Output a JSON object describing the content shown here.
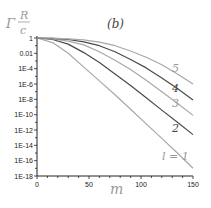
{
  "chart_data": {
    "type": "line",
    "panel_label": "(b)",
    "title": "",
    "xlabel": "m",
    "ylabel": "Γ R/c",
    "ylabel_parts": {
      "prefix": "Γ",
      "numerator": "R",
      "denominator": "c"
    },
    "xlim": [
      0,
      150
    ],
    "ylim_log10": [
      -18,
      0
    ],
    "yscale": "log",
    "grid": false,
    "x_ticks": [
      0,
      50,
      100,
      150
    ],
    "x_tick_labels": [
      "0",
      "50",
      "100",
      "150"
    ],
    "y_ticks_log10": [
      0,
      -2,
      -4,
      -6,
      -8,
      -10,
      -12,
      -14,
      -16,
      -18
    ],
    "y_tick_labels": [
      "1",
      "0.01",
      "1E-4",
      "1E-6",
      "1E-8",
      "1E-10",
      "1E-12",
      "1E-14",
      "1E-16",
      "1E-18"
    ],
    "x": [
      0,
      15,
      30,
      45,
      60,
      75,
      90,
      105,
      120,
      135,
      150
    ],
    "series": [
      {
        "name": "l = 1",
        "label": "l = 1",
        "color": "#a8a8a8",
        "log10_values": [
          0,
          -0.6,
          -2.0,
          -3.8,
          -5.6,
          -7.4,
          -9.3,
          -11.2,
          -13.1,
          -15.0,
          -17.0
        ]
      },
      {
        "name": "2",
        "label": "2",
        "color": "#4a4a4a",
        "log10_values": [
          0,
          -0.2,
          -0.8,
          -1.9,
          -3.2,
          -4.7,
          -6.2,
          -7.8,
          -9.4,
          -11.0,
          -12.6
        ]
      },
      {
        "name": "3",
        "label": "3",
        "color": "#a8a8a8",
        "log10_values": [
          0,
          -0.1,
          -0.4,
          -0.9,
          -1.8,
          -2.9,
          -4.1,
          -5.5,
          -7.0,
          -8.5,
          -10.1
        ]
      },
      {
        "name": "4",
        "label": "4",
        "color": "#4a4a4a",
        "log10_values": [
          0,
          -0.05,
          -0.2,
          -0.5,
          -1.0,
          -1.8,
          -2.8,
          -3.9,
          -5.2,
          -6.6,
          -8.1
        ]
      },
      {
        "name": "5",
        "label": "5",
        "color": "#a8a8a8",
        "log10_values": [
          0,
          -0.02,
          -0.1,
          -0.25,
          -0.55,
          -1.0,
          -1.7,
          -2.5,
          -3.5,
          -4.7,
          -6.0
        ]
      }
    ],
    "annotations": [
      "5",
      "4",
      "3",
      "2",
      "l = 1",
      "(b)"
    ]
  }
}
